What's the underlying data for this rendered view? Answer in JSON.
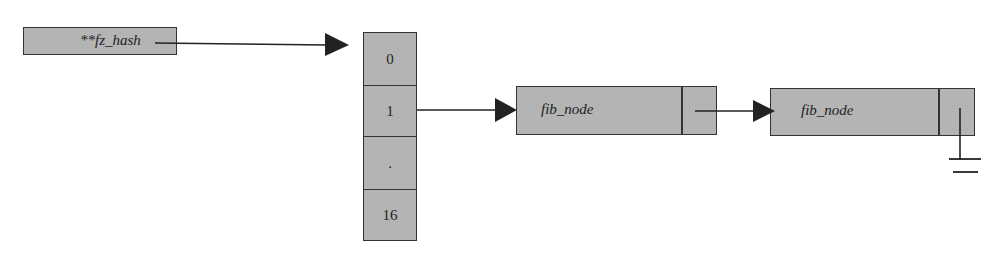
{
  "diagram": {
    "type": "data-structure",
    "colors": {
      "box_fill": "#b4b4b4",
      "stroke": "#333333",
      "text": "#222222",
      "background": "#ffffff"
    },
    "pointer": {
      "label": "**fz_hash"
    },
    "array": {
      "cells": [
        {
          "label": "0"
        },
        {
          "label": "1"
        },
        {
          "label": "."
        },
        {
          "label": "16"
        }
      ]
    },
    "nodes": [
      {
        "label": "fib_node"
      },
      {
        "label": "fib_node"
      }
    ],
    "edges": [
      {
        "from": "**fz_hash",
        "to": "array",
        "style": "arrow"
      },
      {
        "from": "array.cell.1",
        "to": "node.0",
        "style": "arrow"
      },
      {
        "from": "node.0.next",
        "to": "node.1",
        "style": "arrow"
      },
      {
        "from": "node.1.next",
        "to": "null",
        "style": "ground"
      }
    ]
  }
}
